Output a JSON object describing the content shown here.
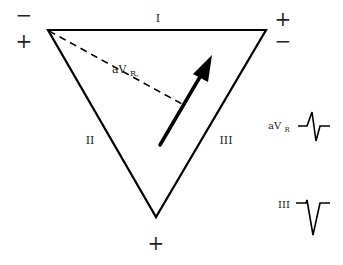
{
  "diagram": {
    "leads": {
      "lead_I": "I",
      "lead_II": "II",
      "lead_III": "III",
      "aVR_main": "aV",
      "aVR_sub": "R,",
      "aVR_side_main": "aV",
      "aVR_side_sub": "R",
      "lead_III_side": "III"
    },
    "polarity": {
      "top_left_upper": "−",
      "top_left_lower": "+",
      "top_right_upper": "+",
      "top_right_lower": "−",
      "bottom": "+"
    },
    "colors": {
      "line": "#000000",
      "text": "#222222",
      "background": "#ffffff"
    }
  }
}
